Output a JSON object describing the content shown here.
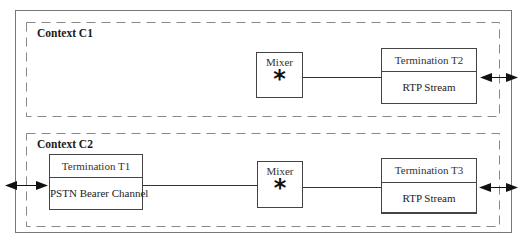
{
  "diagram": {
    "contexts": [
      {
        "label": "Context C1",
        "mixer": {
          "label": "Mixer",
          "symbol": "*"
        },
        "terminations": [
          {
            "title": "Termination T2",
            "body": "RTP Stream"
          }
        ]
      },
      {
        "label": "Context C2",
        "mixer": {
          "label": "Mixer",
          "symbol": "*"
        },
        "terminations": [
          {
            "title": "Termination T1",
            "body": "PSTN Bearer Channel"
          },
          {
            "title": "Termination T3",
            "body": "RTP Stream"
          }
        ]
      }
    ],
    "colors": {
      "outer_border": "#777777",
      "dashed_border": "#888888",
      "box_border": "#444444",
      "line": "#333333",
      "arrow": "#111111"
    }
  }
}
